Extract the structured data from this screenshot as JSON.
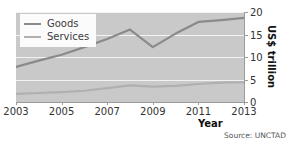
{
  "chart_data": {
    "type": "line",
    "title": "",
    "xlabel": "Year",
    "ylabel": "US$ trillion",
    "x": [
      2003,
      2004,
      2005,
      2006,
      2007,
      2008,
      2009,
      2010,
      2011,
      2012,
      2013
    ],
    "xlim": [
      2003,
      2013
    ],
    "ylim": [
      0,
      20
    ],
    "xticks": [
      2003,
      2005,
      2007,
      2009,
      2011,
      2013
    ],
    "yticks": [
      0,
      5,
      10,
      15,
      20
    ],
    "grid": "horizontal",
    "legend_position": "top-left",
    "series": [
      {
        "name": "Goods",
        "color": "#8a8a8a",
        "values": [
          7.8,
          9.2,
          10.5,
          12.2,
          14.0,
          16.1,
          12.2,
          15.2,
          17.8,
          18.2,
          18.7
        ]
      },
      {
        "name": "Services",
        "color": "#b0b0b0",
        "values": [
          1.8,
          2.0,
          2.2,
          2.5,
          3.1,
          3.7,
          3.4,
          3.6,
          4.0,
          4.3,
          4.4
        ]
      }
    ],
    "source": "Source: UNCTAD",
    "plot_background": "#c9c9c9",
    "gridline_color": "#f2f2f2"
  },
  "legend": {
    "items": [
      {
        "label": "Goods"
      },
      {
        "label": "Services"
      }
    ]
  },
  "axes": {
    "x_title": "Year",
    "y_title": "US$ trillion",
    "x_tick_labels": [
      "2003",
      "2005",
      "2007",
      "2009",
      "2011",
      "2013"
    ],
    "y_tick_labels": [
      "0",
      "5",
      "10",
      "15",
      "20"
    ]
  },
  "footer": {
    "source": "Source: UNCTAD"
  }
}
